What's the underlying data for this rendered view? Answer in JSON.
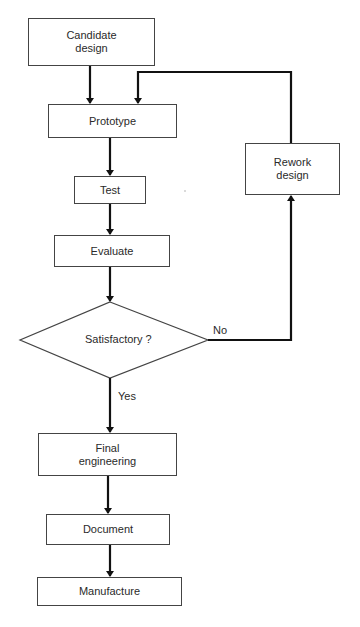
{
  "diagram": {
    "type": "flowchart",
    "nodes": {
      "candidate_design": {
        "label_line1": "Candidate",
        "label_line2": "design",
        "shape": "process"
      },
      "prototype": {
        "label": "Prototype",
        "shape": "process"
      },
      "test": {
        "label": "Test",
        "shape": "process"
      },
      "evaluate": {
        "label": "Evaluate",
        "shape": "process"
      },
      "satisfactory": {
        "label": "Satisfactory ?",
        "shape": "decision"
      },
      "rework_design": {
        "label_line1": "Rework",
        "label_line2": "design",
        "shape": "process"
      },
      "final_engineering": {
        "label_line1": "Final",
        "label_line2": "engineering",
        "shape": "process"
      },
      "document": {
        "label": "Document",
        "shape": "process"
      },
      "manufacture": {
        "label": "Manufacture",
        "shape": "process"
      }
    },
    "edges": [
      {
        "from": "Candidate design",
        "to": "Prototype"
      },
      {
        "from": "Prototype",
        "to": "Test"
      },
      {
        "from": "Test",
        "to": "Evaluate"
      },
      {
        "from": "Evaluate",
        "to": "Satisfactory ?"
      },
      {
        "from": "Satisfactory ?",
        "to": "Rework design",
        "label": "No"
      },
      {
        "from": "Rework design",
        "to": "Prototype"
      },
      {
        "from": "Satisfactory ?",
        "to": "Final engineering",
        "label": "Yes"
      },
      {
        "from": "Final engineering",
        "to": "Document"
      },
      {
        "from": "Document",
        "to": "Manufacture"
      }
    ],
    "edge_labels": {
      "no": "No",
      "yes": "Yes"
    },
    "colors": {
      "line": "#111111",
      "border": "#444444",
      "background": "#ffffff",
      "text": "#2a2a2a"
    }
  }
}
